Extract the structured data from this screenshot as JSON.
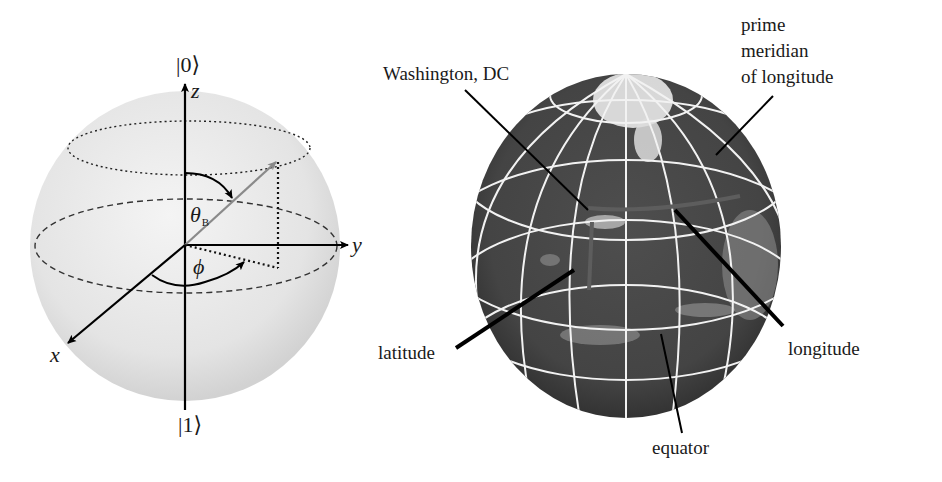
{
  "bloch_sphere": {
    "top_state": "|0⟩",
    "bottom_state": "|1⟩",
    "axis_labels": {
      "z": "z",
      "y": "y",
      "x": "x"
    },
    "polar_angle": {
      "symbol": "θ",
      "subscript": "B"
    },
    "azimuthal_angle": {
      "symbol": "ϕ"
    },
    "colors": {
      "sphere_fill": "#e6e6e6",
      "axis": "#000000",
      "state_vector": "#8a8a8a"
    }
  },
  "globe": {
    "labels": {
      "washington": "Washington, DC",
      "prime_meridian_line1": "prime",
      "prime_meridian_line2": "meridian",
      "prime_meridian_line3": "of longitude",
      "latitude": "latitude",
      "longitude": "longitude",
      "equator": "equator"
    },
    "colors": {
      "earth": "#4a4a4a",
      "grid": "#f2f2f2",
      "clouds": "#d8d8d8",
      "leader": "#000000"
    }
  }
}
